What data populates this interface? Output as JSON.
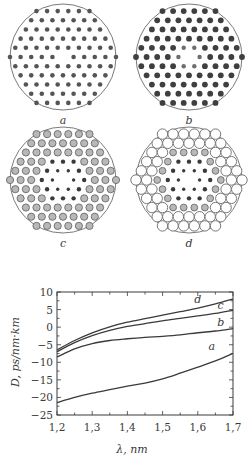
{
  "panels": [
    {
      "label": "a",
      "description": "all holes equal, small dark",
      "rings": [
        {
          "r": 2.3,
          "fill": "#555555",
          "stroke": "none"
        },
        {
          "r": 2.3,
          "fill": "#555555",
          "stroke": "none"
        },
        {
          "r": 2.3,
          "fill": "#555555",
          "stroke": "none"
        },
        {
          "r": 2.3,
          "fill": "#555555",
          "stroke": "none"
        },
        {
          "r": 2.3,
          "fill": "#555555",
          "stroke": "none"
        }
      ]
    },
    {
      "label": "b",
      "description": "inner ring smaller gray, outer rings larger dark",
      "rings": [
        {
          "r": 2.2,
          "fill": "#6e6e6e",
          "stroke": "none"
        },
        {
          "r": 2.9,
          "fill": "#3f3f3f",
          "stroke": "none"
        },
        {
          "r": 2.9,
          "fill": "#3f3f3f",
          "stroke": "none"
        },
        {
          "r": 2.9,
          "fill": "#3f3f3f",
          "stroke": "none"
        },
        {
          "r": 2.9,
          "fill": "#3f3f3f",
          "stroke": "none"
        }
      ]
    },
    {
      "label": "c",
      "description": "inner two rings dark, outer three rings gray outlined",
      "rings": [
        {
          "r": 1.7,
          "fill": "#3a3a3a",
          "stroke": "none"
        },
        {
          "r": 2.2,
          "fill": "#3a3a3a",
          "stroke": "none"
        },
        {
          "r": 3.6,
          "fill": "#b8b8b8",
          "stroke": "#6a6a6a"
        },
        {
          "r": 3.6,
          "fill": "#b8b8b8",
          "stroke": "#6a6a6a"
        },
        {
          "r": 3.6,
          "fill": "#b8b8b8",
          "stroke": "#6a6a6a"
        }
      ]
    },
    {
      "label": "d",
      "description": "inner dark, middle gray, outer two rings large open",
      "rings": [
        {
          "r": 1.7,
          "fill": "#3a3a3a",
          "stroke": "none"
        },
        {
          "r": 2.2,
          "fill": "#3a3a3a",
          "stroke": "none"
        },
        {
          "r": 3.4,
          "fill": "#b8b8b8",
          "stroke": "#6a6a6a"
        },
        {
          "r": 5.2,
          "fill": "#ffffff",
          "stroke": "#6a6a6a"
        },
        {
          "r": 5.2,
          "fill": "#ffffff",
          "stroke": "#6a6a6a"
        }
      ]
    }
  ],
  "chart_data": {
    "type": "line",
    "title": "",
    "xlabel": "λ, nm",
    "ylabel": "D, ps/nm·km",
    "xlim": [
      1.2,
      1.7
    ],
    "ylim": [
      -25,
      10
    ],
    "xticks": [
      "1,2",
      "1,3",
      "1,4",
      "1,5",
      "1,6",
      "1,7"
    ],
    "xtick_values": [
      1.2,
      1.3,
      1.4,
      1.5,
      1.6,
      1.7
    ],
    "yticks": [
      "10",
      "5",
      "0",
      "−5",
      "−10",
      "−15",
      "−20",
      "−25"
    ],
    "ytick_values": [
      10,
      5,
      0,
      -5,
      -10,
      -15,
      -20,
      -25
    ],
    "grid": false,
    "legend": "inline curve labels",
    "x": [
      1.2,
      1.25,
      1.3,
      1.35,
      1.4,
      1.45,
      1.5,
      1.55,
      1.6,
      1.65,
      1.7
    ],
    "series": [
      {
        "name": "a",
        "values": [
          -21.5,
          -20.0,
          -18.8,
          -17.8,
          -16.8,
          -15.9,
          -14.7,
          -13.1,
          -11.4,
          -9.6,
          -7.5
        ]
      },
      {
        "name": "b",
        "values": [
          -8.5,
          -6.2,
          -4.7,
          -3.8,
          -3.3,
          -2.9,
          -2.6,
          -2.2,
          -1.6,
          -1.1,
          -0.4
        ]
      },
      {
        "name": "c",
        "values": [
          -7.0,
          -4.4,
          -2.4,
          -0.9,
          0.2,
          1.0,
          1.8,
          2.5,
          3.2,
          3.9,
          4.8
        ]
      },
      {
        "name": "d",
        "values": [
          -6.5,
          -3.8,
          -1.6,
          0.1,
          1.4,
          2.4,
          3.4,
          4.4,
          5.4,
          6.6,
          8.0
        ]
      }
    ],
    "curve_labels": [
      {
        "name": "d",
        "x": 1.6,
        "y": 6.8
      },
      {
        "name": "c",
        "x": 1.665,
        "y": 5.2
      },
      {
        "name": "b",
        "x": 1.665,
        "y": 0.3
      },
      {
        "name": "a",
        "x": 1.64,
        "y": -6.5
      }
    ]
  }
}
